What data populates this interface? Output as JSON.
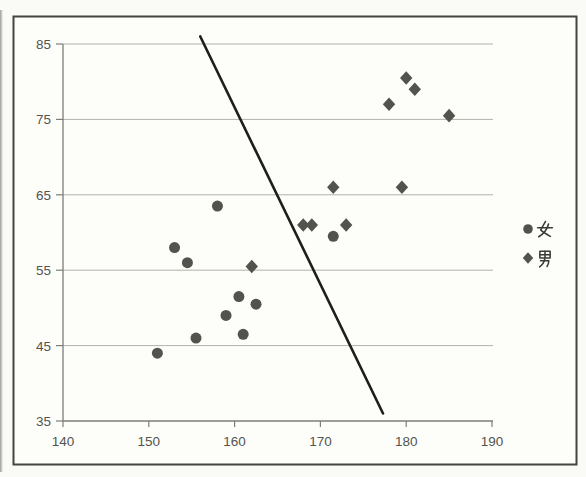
{
  "chart_data": {
    "type": "scatter",
    "title": "",
    "xlabel": "",
    "ylabel": "",
    "xlim": [
      140,
      190
    ],
    "ylim": [
      35,
      85
    ],
    "x_ticks": [
      140,
      150,
      160,
      170,
      180,
      190
    ],
    "y_ticks": [
      35,
      45,
      55,
      65,
      75,
      85
    ],
    "grid": "horizontal",
    "legend_position": "right-center",
    "series": [
      {
        "name": "女",
        "marker": "circle",
        "color": "#53534d",
        "points": [
          [
            151,
            44
          ],
          [
            153,
            58
          ],
          [
            154.5,
            56
          ],
          [
            155.5,
            46
          ],
          [
            158,
            63.5
          ],
          [
            159,
            49
          ],
          [
            160.5,
            51.5
          ],
          [
            161,
            46.5
          ],
          [
            162.5,
            50.5
          ],
          [
            171.5,
            59.5
          ]
        ]
      },
      {
        "name": "男",
        "marker": "diamond",
        "color": "#53534d",
        "points": [
          [
            162,
            55.5
          ],
          [
            168,
            61
          ],
          [
            169,
            61
          ],
          [
            171.5,
            66
          ],
          [
            173,
            61
          ],
          [
            178,
            77
          ],
          [
            179.5,
            66
          ],
          [
            180,
            80.5
          ],
          [
            181,
            79
          ],
          [
            185,
            75.5
          ]
        ]
      }
    ],
    "discriminant_line": {
      "x1": 156,
      "y1": 86,
      "x2": 177.3,
      "y2": 36
    }
  },
  "legend": {
    "items": [
      {
        "label": "女",
        "marker": "circle"
      },
      {
        "label": "男",
        "marker": "diamond"
      }
    ]
  },
  "colors": {
    "page_bg": "#fafaf6",
    "plot_bg": "#fdfdfa",
    "frame": "#45453f",
    "gridline": "#b2b2a9",
    "axis": "#7e7e77",
    "tick_label": "#54544e",
    "marker": "#53534d",
    "line": "#1e1e1c",
    "legend_glyph": "#3a3a35"
  }
}
